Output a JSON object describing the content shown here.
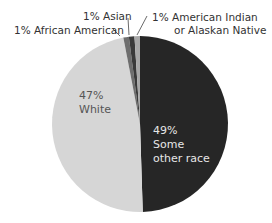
{
  "chart_data": {
    "type": "pie",
    "title": "",
    "start_angle_deg": 0,
    "direction": "clockwise",
    "slices": [
      {
        "label": "Some other race",
        "value": 49,
        "value_label": "49%",
        "color": "#262626"
      },
      {
        "label": "White",
        "value": 47,
        "value_label": "47%",
        "color": "#d6d6d6"
      },
      {
        "label": "African American",
        "value": 1,
        "value_label": "1%",
        "color": "#6e6e6e"
      },
      {
        "label": "Asian",
        "value": 1,
        "value_label": "1%",
        "color": "#3a3a3a"
      },
      {
        "label": "American Indian or Alaskan Native",
        "value": 1,
        "value_label": "1%",
        "color": "#a8a8a8"
      }
    ]
  },
  "labels": {
    "other_pct": "49%",
    "other_line1": "Some",
    "other_line2": "other race",
    "white_pct": "47%",
    "white_name": "White",
    "african": "1% African American",
    "asian": "1% Asian",
    "amind_line1": "1% American Indian",
    "amind_line2": "or Alaskan Native"
  }
}
